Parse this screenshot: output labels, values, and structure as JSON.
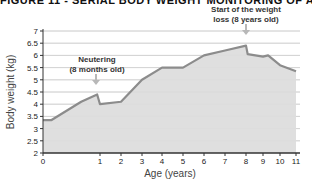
{
  "title": "FIGURE 11 - SERIAL BODY WEIGHT MONITORING OF A C",
  "chart_data": {
    "type": "area",
    "title": "FIGURE 11 - SERIAL BODY WEIGHT MONITORING OF A C",
    "xlabel": "Age (years)",
    "ylabel": "Body weight (kg)",
    "xlim": [
      0,
      11
    ],
    "ylim": [
      2,
      7
    ],
    "x_ticks": [
      0,
      1,
      2,
      3,
      4,
      5,
      6,
      7,
      8,
      9,
      10,
      11
    ],
    "y_ticks": [
      "2",
      "2.5",
      "3",
      "3.5",
      "4",
      "4.5",
      "5",
      "5.5",
      "6",
      "6.5",
      "7"
    ],
    "grid": true,
    "x": [
      0,
      0.15,
      0.67,
      0.95,
      1.0,
      2,
      3,
      4,
      5,
      6,
      7,
      8,
      8.1,
      9,
      9.3,
      10,
      11
    ],
    "values": [
      3.35,
      3.35,
      4.1,
      4.4,
      4.0,
      4.1,
      5.0,
      5.5,
      5.5,
      6.0,
      6.2,
      6.4,
      6.05,
      5.95,
      6.0,
      5.6,
      5.35
    ],
    "annotations": [
      {
        "text_line1": "Neutering",
        "text_line2": "(8 months old)",
        "x": 0.95
      },
      {
        "text_line1": "Start of the weight",
        "text_line2": "loss (8 years old)",
        "x": 8
      }
    ],
    "colors": {
      "line": "#8c8c8c",
      "fill": "#d9d9d9",
      "grid": "#c8c8c8",
      "axis": "#333333",
      "arrow": "#b8b8b8"
    }
  }
}
